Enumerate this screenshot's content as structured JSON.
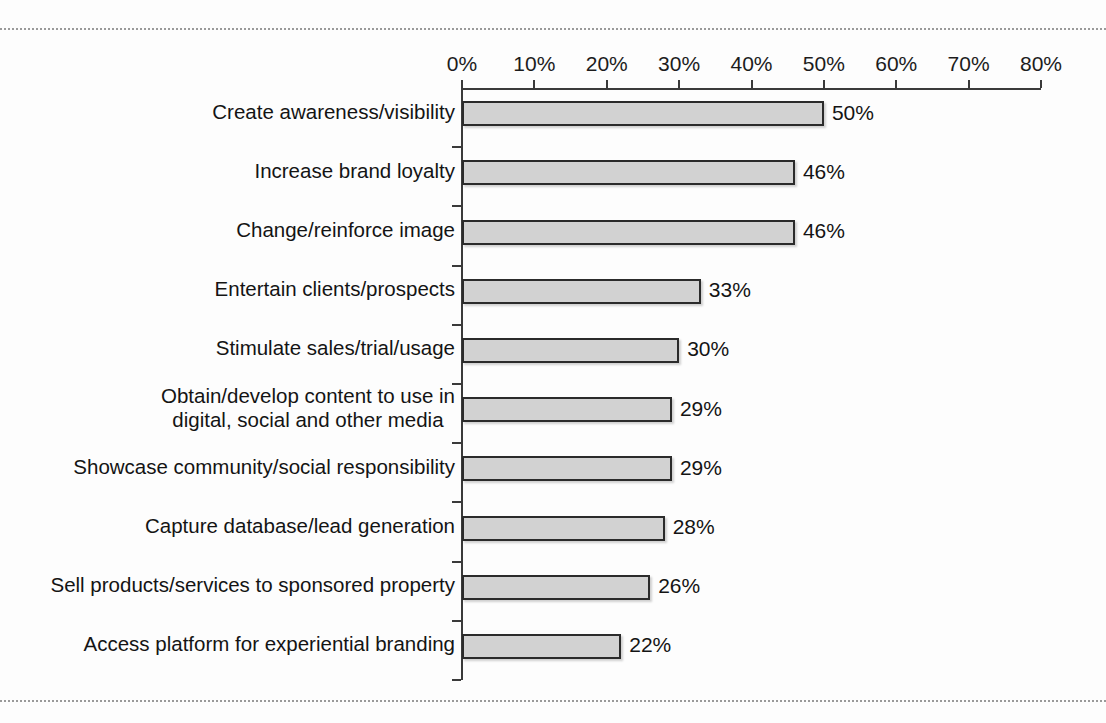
{
  "page": {
    "background_color": "#fdfdfd",
    "rules": {
      "top_label": "top-dotted-rule",
      "bottom_label": "bottom-dotted-rule"
    }
  },
  "chart_data": {
    "type": "bar",
    "orientation": "horizontal",
    "title": "",
    "subtitle": "",
    "xlabel": "",
    "ylabel": "",
    "xlim": [
      0,
      80
    ],
    "grid": false,
    "legend": false,
    "bar_fill_color": "#d2d2d2",
    "bar_border_color": "#2b2b2b",
    "axis_color": "#3a3a3a",
    "tick_labels": [
      "0%",
      "10%",
      "20%",
      "30%",
      "40%",
      "50%",
      "60%",
      "70%",
      "80%"
    ],
    "tick_values": [
      0,
      10,
      20,
      30,
      40,
      50,
      60,
      70,
      80
    ],
    "categories": [
      "Create awareness/visibility",
      "Increase brand loyalty",
      "Change/reinforce image",
      "Entertain clients/prospects",
      "Stimulate sales/trial/usage",
      "Obtain/develop content to use in\ndigital, social and other media",
      "Showcase community/social responsibility",
      "Capture database/lead generation",
      "Sell products/services to sponsored property",
      "Access platform for experiential branding"
    ],
    "values": [
      50,
      46,
      46,
      33,
      30,
      29,
      29,
      28,
      26,
      22
    ],
    "value_labels": [
      "50%",
      "46%",
      "46%",
      "33%",
      "30%",
      "29%",
      "29%",
      "28%",
      "26%",
      "22%"
    ]
  }
}
